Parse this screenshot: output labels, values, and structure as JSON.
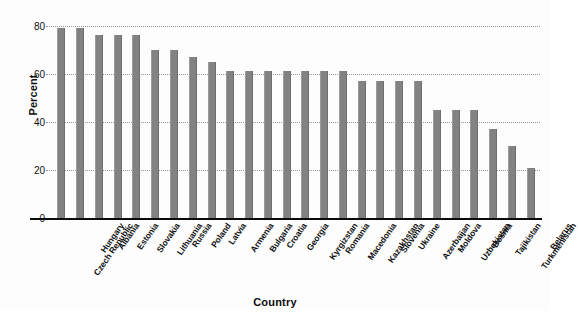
{
  "chart_data": {
    "type": "bar",
    "title": "",
    "xlabel": "Country",
    "ylabel": "Percent",
    "ylim": [
      0,
      84
    ],
    "yticks": [
      0,
      20,
      40,
      60,
      80
    ],
    "ytick_labels": [
      "0",
      "20",
      "40",
      "60",
      "80"
    ],
    "grid": "dotted horizontal gridlines",
    "legend": "none",
    "bar_color": "#828282",
    "categories": [
      "Czech Republic",
      "Hungary",
      "Albania",
      "Estonia",
      "Slovakia",
      "Lithuania",
      "Russia",
      "Poland",
      "Latvia",
      "Armenia",
      "Bulgaria",
      "Croatia",
      "Georgia",
      "Kyrgizstan",
      "Romania",
      "Macedonia",
      "Kazakhstan",
      "Slovenia",
      "Ukraine",
      "Azerbaijan",
      "Moldova",
      "Uzbekistan",
      "Bosnia",
      "Tajikistan",
      "Turkmenistan",
      "Belarus"
    ],
    "values": [
      79,
      79,
      76,
      76,
      76,
      70,
      70,
      67,
      65,
      61,
      61,
      61,
      61,
      61,
      61,
      61,
      57,
      57,
      57,
      57,
      45,
      45,
      45,
      37,
      30,
      21
    ]
  }
}
